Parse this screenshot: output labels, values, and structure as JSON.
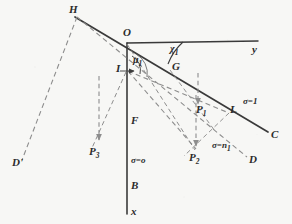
{
  "figure": {
    "background_color": "#f7f7f5",
    "ink_color": "#2e2e2e",
    "dash_color": "#8d8d8d",
    "points": {
      "H": "H",
      "O": "O",
      "I": "I",
      "G": "G",
      "F": "F",
      "B": "B",
      "L": "L",
      "C": "C",
      "D": "D",
      "Dprime": "D'",
      "P1": "P",
      "P1_sub": "1",
      "P2": "P",
      "P2_sub": "2",
      "P3": "P",
      "P3_sub": "3"
    },
    "axes": {
      "x": "x",
      "y": "y"
    },
    "angles": [
      {
        "name": "chi-one",
        "symbol": "χ",
        "sub": "1"
      },
      {
        "name": "mu-one",
        "symbol": "μ",
        "sub": "1"
      }
    ],
    "sigma_labels": [
      {
        "name": "sigma-equals-one",
        "text": "σ=1"
      },
      {
        "name": "sigma-equals-n1",
        "text": "σ=n",
        "sub": "1"
      },
      {
        "name": "sigma-equals-zero",
        "text": "σ=o"
      }
    ],
    "geometry": {
      "O": [
        127,
        43
      ],
      "H": [
        76,
        14
      ],
      "I": [
        127,
        70
      ],
      "G": [
        170,
        69
      ],
      "F": [
        127,
        123
      ],
      "B": [
        127,
        186
      ],
      "x_tip": [
        127,
        214
      ],
      "y_tip": [
        258,
        41
      ],
      "C": [
        270,
        133
      ],
      "L": [
        229,
        114
      ],
      "D": [
        248,
        159
      ],
      "Dprime": [
        20,
        162
      ],
      "P1": [
        198,
        109
      ],
      "P2": [
        196,
        152
      ],
      "P3": [
        96,
        147
      ]
    }
  }
}
